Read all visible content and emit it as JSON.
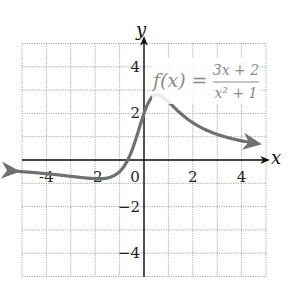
{
  "chart_data": {
    "type": "line",
    "title": "",
    "xlabel": "x",
    "ylabel": "y",
    "xlim": [
      -5,
      5
    ],
    "ylim": [
      -5,
      5
    ],
    "grid": true,
    "x_ticks": [
      -4,
      -2,
      0,
      2,
      4
    ],
    "y_ticks": [
      -4,
      -2,
      2,
      4
    ],
    "tick_labels": {
      "x": [
        "-4",
        "-2",
        "0",
        "2",
        "4"
      ],
      "y": [
        "4",
        "2",
        "−2",
        "−4"
      ]
    },
    "annotation": {
      "lhs": "f(x) =",
      "numerator": "3x + 2",
      "denominator": "x² + 1"
    },
    "series": [
      {
        "name": "f(x) = (3x + 2)/(x² + 1)",
        "color": "#707070",
        "x": [
          -5.3,
          -4,
          -3,
          -2,
          -1.5,
          -1,
          -0.5,
          0,
          0.3,
          0.55,
          0.8,
          1,
          1.5,
          2,
          3,
          4,
          4.6
        ],
        "y": [
          -0.48,
          -0.59,
          -0.7,
          -0.8,
          -0.77,
          -0.5,
          0.4,
          2,
          2.66,
          2.77,
          2.71,
          2.5,
          2.0,
          1.6,
          1.1,
          0.82,
          0.72
        ]
      }
    ]
  },
  "axes": {
    "x_label": "x",
    "y_label": "y"
  }
}
